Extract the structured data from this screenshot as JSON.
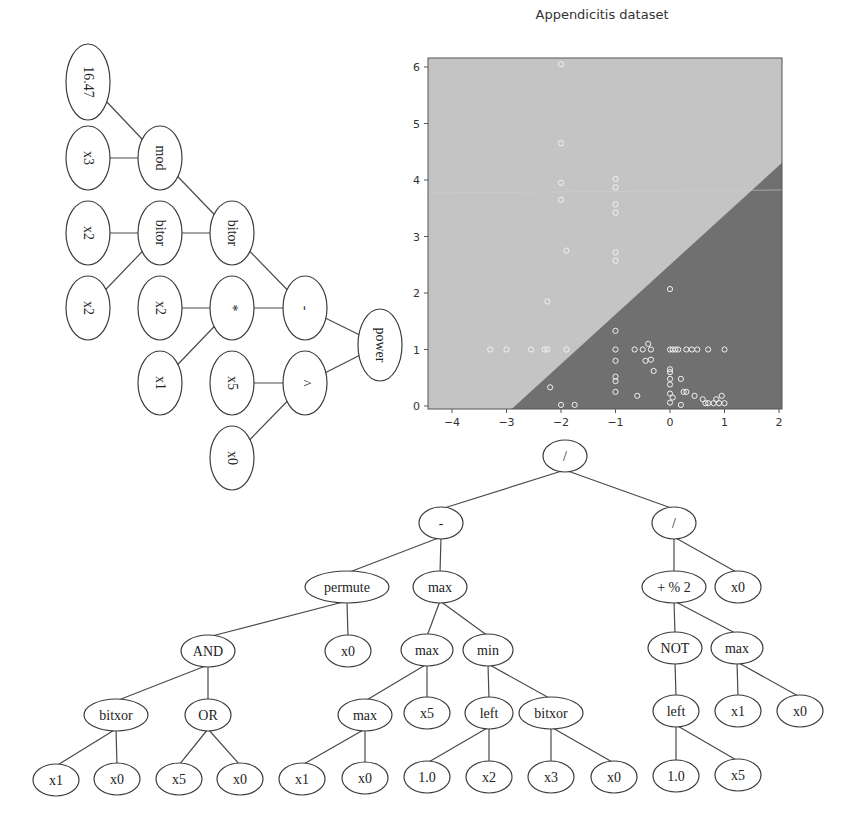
{
  "left_tree": {
    "orientation": "rotated-90",
    "nodes": [
      {
        "id": "n1",
        "label": "16.47",
        "cx": 88,
        "cy": 82
      },
      {
        "id": "n2",
        "label": "x3",
        "cx": 88,
        "cy": 158
      },
      {
        "id": "n3",
        "label": "mod",
        "cx": 160,
        "cy": 158
      },
      {
        "id": "n4",
        "label": "x2",
        "cx": 88,
        "cy": 233
      },
      {
        "id": "n5",
        "label": "bitor",
        "cx": 160,
        "cy": 233
      },
      {
        "id": "n6",
        "label": "bitor",
        "cx": 232,
        "cy": 233
      },
      {
        "id": "n7",
        "label": "x2",
        "cx": 88,
        "cy": 308
      },
      {
        "id": "n8",
        "label": "x2",
        "cx": 160,
        "cy": 308
      },
      {
        "id": "n9",
        "label": "*",
        "cx": 232,
        "cy": 308
      },
      {
        "id": "n10",
        "label": "-",
        "cx": 305,
        "cy": 308
      },
      {
        "id": "n11",
        "label": "x1",
        "cx": 160,
        "cy": 383
      },
      {
        "id": "n12",
        "label": "x5",
        "cx": 232,
        "cy": 383
      },
      {
        "id": "n13",
        "label": "^",
        "cx": 305,
        "cy": 383
      },
      {
        "id": "n14",
        "label": "power",
        "cx": 380,
        "cy": 345
      },
      {
        "id": "n15",
        "label": "x0",
        "cx": 232,
        "cy": 458
      }
    ],
    "edges": [
      [
        "n1",
        "n3"
      ],
      [
        "n2",
        "n3"
      ],
      [
        "n3",
        "n6"
      ],
      [
        "n4",
        "n5"
      ],
      [
        "n5",
        "n6"
      ],
      [
        "n7",
        "n5"
      ],
      [
        "n8",
        "n9"
      ],
      [
        "n11",
        "n9"
      ],
      [
        "n6",
        "n10"
      ],
      [
        "n9",
        "n10"
      ],
      [
        "n10",
        "n14"
      ],
      [
        "n12",
        "n13"
      ],
      [
        "n15",
        "n13"
      ],
      [
        "n13",
        "n14"
      ]
    ]
  },
  "chart": {
    "title": "Appendicitis dataset",
    "x_ticks": [
      "−4",
      "−3",
      "−2",
      "−1",
      "0",
      "1",
      "2"
    ],
    "y_ticks": [
      "0",
      "1",
      "2",
      "3",
      "4",
      "5",
      "6"
    ],
    "colors": {
      "region_light": "#c4c4c4",
      "region_dark": "#707070",
      "frame": "#555555",
      "points": "#f2f2f2"
    }
  },
  "chart_data": {
    "type": "scatter",
    "title": "Appendicitis dataset",
    "xlabel": "",
    "ylabel": "",
    "xlim": [
      -4.45,
      2.05
    ],
    "ylim": [
      -0.05,
      6.15
    ],
    "x_ticks": [
      -4,
      -3,
      -2,
      -1,
      0,
      1,
      2
    ],
    "y_ticks": [
      0,
      1,
      2,
      3,
      4,
      5,
      6
    ],
    "grid": false,
    "legend": null,
    "decision_boundary": {
      "description": "linear boundary; light region upper-left, dark region lower-right",
      "points": [
        [
          -2.9,
          -0.05
        ],
        [
          2.05,
          4.3
        ]
      ]
    },
    "series": [
      {
        "name": "samples",
        "points": [
          [
            -2.0,
            6.05
          ],
          [
            -2.0,
            4.65
          ],
          [
            -2.0,
            3.95
          ],
          [
            -2.0,
            3.65
          ],
          [
            -1.9,
            2.75
          ],
          [
            -1.0,
            4.02
          ],
          [
            -1.0,
            3.87
          ],
          [
            -1.0,
            3.57
          ],
          [
            -1.0,
            3.42
          ],
          [
            -1.0,
            2.72
          ],
          [
            -1.0,
            2.57
          ],
          [
            -2.25,
            1.85
          ],
          [
            -3.3,
            1.0
          ],
          [
            -3.0,
            1.0
          ],
          [
            -2.55,
            1.0
          ],
          [
            -2.3,
            1.0
          ],
          [
            -2.25,
            1.0
          ],
          [
            -1.9,
            1.0
          ],
          [
            -2.2,
            0.33
          ],
          [
            -2.0,
            0.02
          ],
          [
            -1.75,
            0.02
          ],
          [
            0.0,
            2.07
          ],
          [
            -1.0,
            1.33
          ],
          [
            -1.0,
            1.0
          ],
          [
            -0.65,
            1.0
          ],
          [
            -0.5,
            1.0
          ],
          [
            -0.4,
            1.1
          ],
          [
            -0.35,
            1.0
          ],
          [
            0.0,
            1.0
          ],
          [
            0.05,
            1.0
          ],
          [
            0.1,
            1.0
          ],
          [
            0.15,
            1.0
          ],
          [
            0.3,
            1.0
          ],
          [
            0.4,
            1.0
          ],
          [
            0.5,
            1.0
          ],
          [
            0.7,
            1.0
          ],
          [
            1.0,
            1.0
          ],
          [
            -1.0,
            0.8
          ],
          [
            -0.45,
            0.8
          ],
          [
            -0.35,
            0.82
          ],
          [
            -0.3,
            0.62
          ],
          [
            0.0,
            0.65
          ],
          [
            0.0,
            0.6
          ],
          [
            0.0,
            0.48
          ],
          [
            0.0,
            0.38
          ],
          [
            0.2,
            0.48
          ],
          [
            -1.0,
            0.52
          ],
          [
            -1.0,
            0.44
          ],
          [
            -1.0,
            0.25
          ],
          [
            -0.6,
            0.18
          ],
          [
            0.0,
            0.22
          ],
          [
            0.05,
            0.15
          ],
          [
            0.25,
            0.25
          ],
          [
            0.3,
            0.25
          ],
          [
            0.45,
            0.18
          ],
          [
            0.0,
            0.06
          ],
          [
            0.2,
            0.02
          ],
          [
            0.6,
            0.12
          ],
          [
            0.65,
            0.05
          ],
          [
            0.7,
            0.05
          ],
          [
            0.8,
            0.05
          ],
          [
            0.85,
            0.12
          ],
          [
            0.9,
            0.05
          ],
          [
            0.95,
            0.18
          ],
          [
            1.0,
            0.05
          ]
        ]
      }
    ]
  },
  "bottom_tree": {
    "nodes": [
      {
        "id": "b1",
        "label": "/",
        "cx": 565,
        "cy": 456,
        "rx": 22,
        "ry": 16
      },
      {
        "id": "b2",
        "label": "-",
        "cx": 441,
        "cy": 523,
        "rx": 22,
        "ry": 16
      },
      {
        "id": "b3",
        "label": "/",
        "cx": 674,
        "cy": 523,
        "rx": 22,
        "ry": 16
      },
      {
        "id": "b4",
        "label": "permute",
        "cx": 347,
        "cy": 587,
        "rx": 42,
        "ry": 16
      },
      {
        "id": "b5",
        "label": "max",
        "cx": 440,
        "cy": 587,
        "rx": 27,
        "ry": 16
      },
      {
        "id": "b6",
        "label": "+ % 2",
        "cx": 674,
        "cy": 587,
        "rx": 32,
        "ry": 16
      },
      {
        "id": "b7",
        "label": "x0",
        "cx": 738,
        "cy": 587,
        "rx": 23,
        "ry": 16
      },
      {
        "id": "b8",
        "label": "AND",
        "cx": 208,
        "cy": 651,
        "rx": 27,
        "ry": 16
      },
      {
        "id": "b9",
        "label": "x0",
        "cx": 348,
        "cy": 651,
        "rx": 23,
        "ry": 16
      },
      {
        "id": "b10",
        "label": "max",
        "cx": 427,
        "cy": 650,
        "rx": 26,
        "ry": 16
      },
      {
        "id": "b11",
        "label": "min",
        "cx": 488,
        "cy": 650,
        "rx": 25,
        "ry": 16
      },
      {
        "id": "b12",
        "label": "NOT",
        "cx": 675,
        "cy": 648,
        "rx": 27,
        "ry": 16
      },
      {
        "id": "b13",
        "label": "max",
        "cx": 737,
        "cy": 648,
        "rx": 26,
        "ry": 16
      },
      {
        "id": "b14",
        "label": "bitxor",
        "cx": 116,
        "cy": 715,
        "rx": 32,
        "ry": 16
      },
      {
        "id": "b15",
        "label": "OR",
        "cx": 208,
        "cy": 715,
        "rx": 23,
        "ry": 16
      },
      {
        "id": "b16",
        "label": "max",
        "cx": 365,
        "cy": 715,
        "rx": 27,
        "ry": 16
      },
      {
        "id": "b17",
        "label": "x5",
        "cx": 427,
        "cy": 713,
        "rx": 23,
        "ry": 16
      },
      {
        "id": "b18",
        "label": "left",
        "cx": 489,
        "cy": 713,
        "rx": 24,
        "ry": 16
      },
      {
        "id": "b19",
        "label": "bitxor",
        "cx": 551,
        "cy": 713,
        "rx": 32,
        "ry": 16
      },
      {
        "id": "b20",
        "label": "left",
        "cx": 676,
        "cy": 711,
        "rx": 23,
        "ry": 16
      },
      {
        "id": "b21",
        "label": "x1",
        "cx": 738,
        "cy": 711,
        "rx": 23,
        "ry": 16
      },
      {
        "id": "b22",
        "label": "x0",
        "cx": 800,
        "cy": 711,
        "rx": 23,
        "ry": 16
      },
      {
        "id": "b23",
        "label": "x1",
        "cx": 56,
        "cy": 780,
        "rx": 23,
        "ry": 16
      },
      {
        "id": "b24",
        "label": "x0",
        "cx": 117,
        "cy": 779,
        "rx": 23,
        "ry": 16
      },
      {
        "id": "b25",
        "label": "x5",
        "cx": 179,
        "cy": 779,
        "rx": 23,
        "ry": 16
      },
      {
        "id": "b26",
        "label": "x0",
        "cx": 240,
        "cy": 779,
        "rx": 23,
        "ry": 16
      },
      {
        "id": "b27",
        "label": "x1",
        "cx": 302,
        "cy": 779,
        "rx": 23,
        "ry": 16
      },
      {
        "id": "b28",
        "label": "x0",
        "cx": 365,
        "cy": 778,
        "rx": 23,
        "ry": 16
      },
      {
        "id": "b29",
        "label": "1.0",
        "cx": 427,
        "cy": 777,
        "rx": 23,
        "ry": 16
      },
      {
        "id": "b30",
        "label": "x2",
        "cx": 489,
        "cy": 777,
        "rx": 23,
        "ry": 16
      },
      {
        "id": "b31",
        "label": "x3",
        "cx": 551,
        "cy": 777,
        "rx": 23,
        "ry": 16
      },
      {
        "id": "b32",
        "label": "x0",
        "cx": 614,
        "cy": 777,
        "rx": 23,
        "ry": 16
      },
      {
        "id": "b33",
        "label": "1.0",
        "cx": 676,
        "cy": 776,
        "rx": 23,
        "ry": 16
      },
      {
        "id": "b34",
        "label": "x5",
        "cx": 738,
        "cy": 775,
        "rx": 23,
        "ry": 16
      }
    ],
    "edges": [
      [
        "b1",
        "b2"
      ],
      [
        "b1",
        "b3"
      ],
      [
        "b2",
        "b4"
      ],
      [
        "b2",
        "b5"
      ],
      [
        "b3",
        "b6"
      ],
      [
        "b3",
        "b7"
      ],
      [
        "b4",
        "b8"
      ],
      [
        "b4",
        "b9"
      ],
      [
        "b5",
        "b10"
      ],
      [
        "b5",
        "b11"
      ],
      [
        "b6",
        "b12"
      ],
      [
        "b6",
        "b13"
      ],
      [
        "b8",
        "b14"
      ],
      [
        "b8",
        "b15"
      ],
      [
        "b10",
        "b16"
      ],
      [
        "b10",
        "b17"
      ],
      [
        "b11",
        "b18"
      ],
      [
        "b11",
        "b19"
      ],
      [
        "b12",
        "b20"
      ],
      [
        "b13",
        "b21"
      ],
      [
        "b13",
        "b22"
      ],
      [
        "b14",
        "b23"
      ],
      [
        "b14",
        "b24"
      ],
      [
        "b15",
        "b25"
      ],
      [
        "b15",
        "b26"
      ],
      [
        "b16",
        "b27"
      ],
      [
        "b16",
        "b28"
      ],
      [
        "b18",
        "b29"
      ],
      [
        "b18",
        "b30"
      ],
      [
        "b19",
        "b31"
      ],
      [
        "b19",
        "b32"
      ],
      [
        "b20",
        "b33"
      ],
      [
        "b20",
        "b34"
      ]
    ]
  }
}
